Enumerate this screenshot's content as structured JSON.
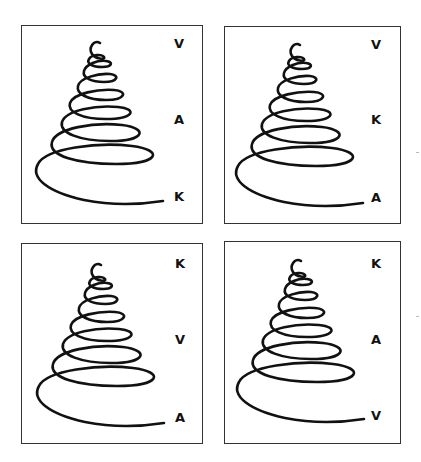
{
  "figure": {
    "panels": [
      {
        "id": "top-left",
        "labels": [
          "V",
          "A",
          "K"
        ]
      },
      {
        "id": "top-right",
        "labels": [
          "V",
          "K",
          "A"
        ]
      },
      {
        "id": "bottom-left",
        "labels": [
          "K",
          "V",
          "A"
        ]
      },
      {
        "id": "bottom-right",
        "labels": [
          "K",
          "A",
          "V"
        ]
      }
    ],
    "stroke_color": "#111111",
    "border_color": "#333333"
  }
}
